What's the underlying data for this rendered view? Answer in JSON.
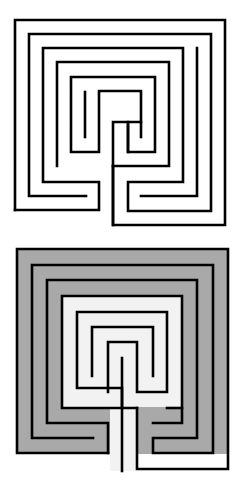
{
  "figure": {
    "panels": [
      {
        "name": "line-drawing",
        "style": "outline"
      },
      {
        "name": "shaded",
        "style": "filled paths"
      }
    ]
  },
  "colors": {
    "background": "#ffffff",
    "wall": "#000000",
    "outer_path_fill": "#a9a9a9",
    "inner_path_fill": "#f2f2f2"
  }
}
